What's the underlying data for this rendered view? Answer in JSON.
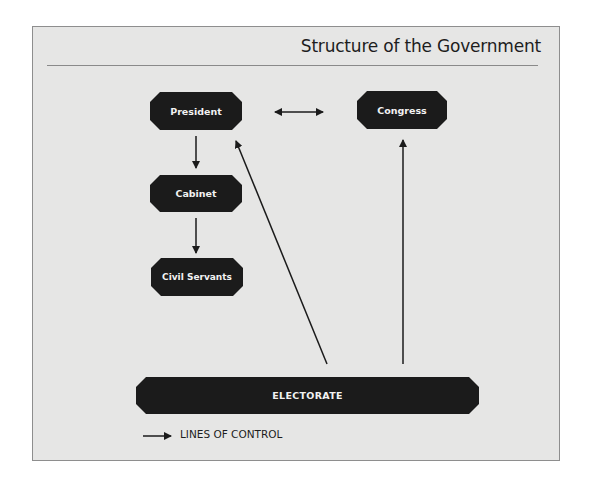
{
  "title": "Structure of the Government",
  "nodes": {
    "president": "President",
    "congress": "Congress",
    "cabinet": "Cabinet",
    "civil_servants": "Civil Servants",
    "electorate": "ELECTORATE"
  },
  "edges": [
    {
      "from": "President",
      "to": "Congress",
      "type": "bidirectional"
    },
    {
      "from": "President",
      "to": "Cabinet",
      "type": "control"
    },
    {
      "from": "Cabinet",
      "to": "Civil Servants",
      "type": "control"
    },
    {
      "from": "Electorate",
      "to": "President",
      "type": "control"
    },
    {
      "from": "Electorate",
      "to": "Congress",
      "type": "control"
    }
  ],
  "legend": {
    "icon": "arrow-right-icon",
    "label": "LINES OF CONTROL"
  },
  "colors": {
    "node_fill": "#1b1b1b",
    "node_text": "#f2f2f2",
    "background": "#e6e6e5",
    "line": "#1b1b1b"
  }
}
